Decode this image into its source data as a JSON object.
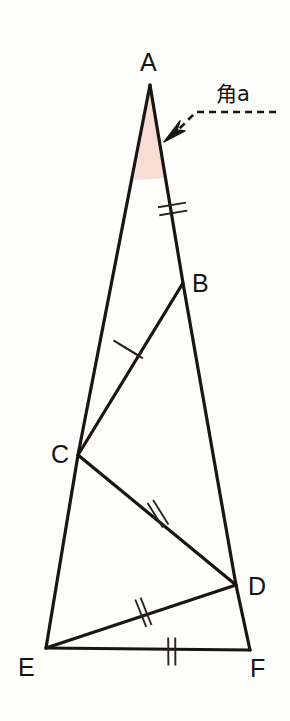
{
  "figure": {
    "background_color": "#fdfdfb",
    "stroke_color": "#191510",
    "shade_color": "#f7ddd5",
    "vertices": [
      {
        "name": "A",
        "label": "A",
        "x": 150,
        "y": 85,
        "label_x": 140,
        "label_y": 71
      },
      {
        "name": "B",
        "label": "B",
        "x": 183,
        "y": 283,
        "label_x": 192,
        "label_y": 292
      },
      {
        "name": "C",
        "label": "C",
        "x": 78,
        "y": 455,
        "label_x": 51,
        "label_y": 463
      },
      {
        "name": "D",
        "label": "D",
        "x": 236,
        "y": 585,
        "label_x": 248,
        "label_y": 595
      },
      {
        "name": "E",
        "label": "E",
        "x": 46,
        "y": 648,
        "label_x": 18,
        "label_y": 676
      },
      {
        "name": "F",
        "label": "F",
        "x": 250,
        "y": 650,
        "label_x": 250,
        "label_y": 677
      }
    ],
    "segments": [
      {
        "name": "A-E-outer-left",
        "from": "A",
        "to": "E",
        "via": "C"
      },
      {
        "name": "A-B-outer-right",
        "from": "A",
        "to": "B"
      },
      {
        "name": "B-D-outer-right",
        "from": "B",
        "to": "D"
      },
      {
        "name": "D-F-outer-right",
        "from": "D",
        "to": "F"
      },
      {
        "name": "E-F-base",
        "from": "E",
        "to": "F"
      },
      {
        "name": "B-C-internal",
        "from": "B",
        "to": "C"
      },
      {
        "name": "C-D-internal",
        "from": "C",
        "to": "D"
      },
      {
        "name": "D-E-internal",
        "from": "D",
        "to": "E"
      }
    ],
    "tick_marks": [
      {
        "name": "tick-AB",
        "segment": "A-B",
        "count": 2,
        "x": 172,
        "y": 212
      },
      {
        "name": "tick-BC",
        "segment": "B-C",
        "count": 2,
        "x": 131,
        "y": 350
      },
      {
        "name": "tick-CD",
        "segment": "C-D",
        "count": 2,
        "x": 158,
        "y": 514
      },
      {
        "name": "tick-DE",
        "segment": "D-E",
        "count": 2,
        "x": 143,
        "y": 613
      },
      {
        "name": "tick-EF",
        "segment": "E-F",
        "count": 2,
        "x": 172,
        "y": 651
      }
    ],
    "shaded_region": {
      "name": "angle-a-shaded-triangle",
      "description": "pink shaded wedge at apex A",
      "color": "#f7ddd5"
    },
    "annotation": {
      "label": "角a",
      "label_x": 216,
      "label_y": 101,
      "leader_from_x": 276,
      "leader_from_y": 112,
      "leader_bend_x": 196,
      "leader_bend_y": 112,
      "arrow_tip_x": 167,
      "arrow_tip_y": 139
    }
  }
}
